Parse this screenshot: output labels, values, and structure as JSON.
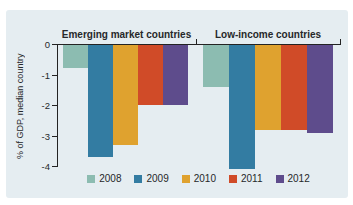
{
  "chart_data": {
    "type": "bar",
    "title": "",
    "ylabel": "% of GDP, median country",
    "yticks": [
      "0",
      "-1",
      "-2",
      "-3",
      "-4"
    ],
    "ylim": [
      0,
      -4.2
    ],
    "grid": false,
    "legend_position": "bottom",
    "background": "#e5edf1",
    "axis_color": "#232323",
    "text_color": "#26282a",
    "categories": [
      "Emerging market countries",
      "Low-income countries"
    ],
    "series": [
      {
        "name": "2008",
        "color": "#8cbcb1",
        "values": [
          -0.8,
          -1.4
        ]
      },
      {
        "name": "2009",
        "color": "#337ca2",
        "values": [
          -3.7,
          -4.1
        ]
      },
      {
        "name": "2010",
        "color": "#dfa22f",
        "values": [
          -3.3,
          -2.8
        ]
      },
      {
        "name": "2011",
        "color": "#d04b28",
        "values": [
          -2.0,
          -2.8
        ]
      },
      {
        "name": "2012",
        "color": "#5e4c8c",
        "values": [
          -2.0,
          -2.9
        ]
      }
    ]
  }
}
